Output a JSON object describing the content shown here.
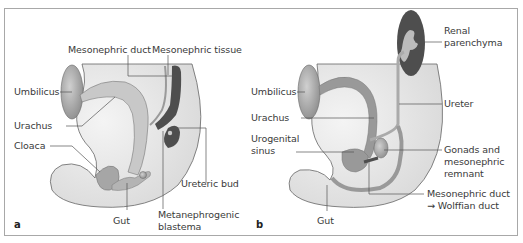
{
  "figure": {
    "panels": [
      {
        "letter": "a",
        "labels": {
          "mesonephric_duct": "Mesonephric duct",
          "mesonephric_tissue": "Mesonephric tissue",
          "umbilicus": "Umbilicus",
          "urachus": "Urachus",
          "cloaca": "Cloaca",
          "ureteric_bud": "Ureteric bud",
          "gut": "Gut",
          "metanephrogenic_1": "Metanephrogenic",
          "metanephrogenic_2": "blastema"
        }
      },
      {
        "letter": "b",
        "labels": {
          "renal_1": "Renal",
          "renal_2": "parenchyma",
          "umbilicus": "Umbilicus",
          "urachus": "Urachus",
          "urogenital_1": "Urogenital",
          "urogenital_2": "sinus",
          "ureter": "Ureter",
          "gonads_1": "Gonads and",
          "gonads_2": "mesonephric",
          "gonads_3": "remnant",
          "mesonephric_1": "Mesonephric duct",
          "mesonephric_2": "→ Wolffian duct",
          "gut": "Gut"
        }
      }
    ],
    "colors": {
      "body_fill": "#e2e2e2",
      "tissue_light": "#b9b9b9",
      "tissue_mid": "#8e8e8e",
      "tissue_dark": "#4a4a4a",
      "outline": "#555555",
      "leader": "#555555",
      "frame": "#a8a8a8"
    }
  }
}
